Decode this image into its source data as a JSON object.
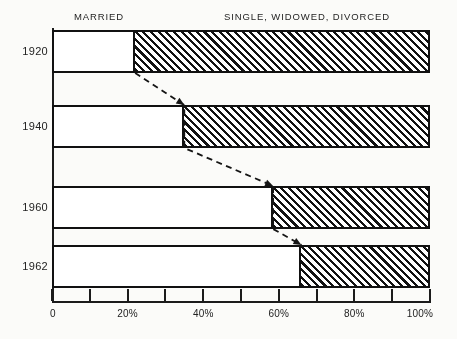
{
  "chart_data": {
    "type": "bar",
    "subtype": "horizontal-stacked-100-percent",
    "title": "",
    "subtitle": "",
    "xlabel": "",
    "ylabel": "",
    "xlim": [
      0,
      100
    ],
    "grid": false,
    "legend_position": "top-inline",
    "categories": [
      "1920",
      "1940",
      "1960",
      "1962"
    ],
    "series": [
      {
        "name": "MARRIED",
        "values": [
          22,
          35,
          58.5,
          66
        ],
        "pattern": "checkerboard"
      },
      {
        "name": "SINGLE, WIDOWED, DIVORCED",
        "values": [
          78,
          65,
          41.5,
          34
        ],
        "pattern": "diagonal-hatch"
      }
    ],
    "x_ticks": [
      0,
      10,
      20,
      30,
      40,
      50,
      60,
      70,
      80,
      90,
      100
    ],
    "x_tick_labels": [
      "0",
      "",
      "20%",
      "",
      "40%",
      "",
      "60%",
      "",
      "80%",
      "",
      "100%"
    ],
    "annotations": [
      {
        "type": "dashed-trend-line",
        "description": "dashed line connecting the MARRIED/SINGLE boundary of each successive bar"
      }
    ]
  },
  "headers": {
    "married": "MARRIED",
    "other": "SINGLE, WIDOWED, DIVORCED"
  },
  "axis": {
    "labels": [
      "0",
      "20%",
      "40%",
      "60%",
      "80%",
      "100%"
    ]
  },
  "rows": [
    {
      "year": "1920",
      "married": 22,
      "other": 78
    },
    {
      "year": "1940",
      "married": 35,
      "other": 65
    },
    {
      "year": "1960",
      "married": 58.5,
      "other": 41.5
    },
    {
      "year": "1962",
      "married": 66,
      "other": 34
    }
  ],
  "colors": {
    "ink": "#111111",
    "background": "#fbfbf9",
    "text": "#222222"
  }
}
